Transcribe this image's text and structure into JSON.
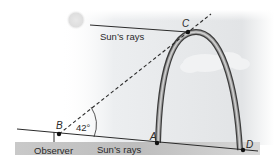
{
  "diagram": {
    "points": {
      "A": "A",
      "B": "B",
      "C": "C",
      "D": "D"
    },
    "angle_label": "42°",
    "labels": {
      "top_rays": "Sun’s rays",
      "bottom_rays": "Sun’s rays",
      "observer": "Observer"
    },
    "colors": {
      "line": "#2b2b2b",
      "sky": "#e4e6e8",
      "ground": "#bdbdbd",
      "arch_dark": "#4a4a4a",
      "arch_light": "#a8a8a8"
    }
  }
}
